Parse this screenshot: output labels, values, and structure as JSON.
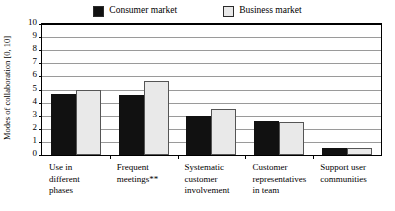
{
  "legend": {
    "position": "top-center",
    "entries": [
      {
        "label": "Consumer market",
        "color": "#111111",
        "swatch_name": "legend-swatch-consumer"
      },
      {
        "label": "Business market",
        "color": "#e9e9e9",
        "swatch_name": "legend-swatch-business"
      }
    ]
  },
  "axis": {
    "y_title": "Modes of collaboration [0, 10]",
    "y_ticks": [
      "10",
      "9",
      "8",
      "7",
      "6",
      "5",
      "4",
      "3",
      "2",
      "1",
      "0"
    ]
  },
  "chart_data": {
    "type": "bar",
    "title": "",
    "subtitle": "",
    "xlabel": "",
    "ylabel": "Modes of collaboration [0, 10]",
    "ylim": [
      0,
      10
    ],
    "yticks": [
      0,
      1,
      2,
      3,
      4,
      5,
      6,
      7,
      8,
      9,
      10
    ],
    "grid": true,
    "legend_position": "top-center",
    "categories": [
      "Use in different phases",
      "Frequent meetings**",
      "Systematic customer involvement",
      "Customer representatives in team",
      "Support user communities"
    ],
    "category_lines": [
      [
        "Use in",
        "different",
        "phases"
      ],
      [
        "Frequent",
        "meetings**"
      ],
      [
        "Systematic",
        "customer",
        "involvement"
      ],
      [
        "Customer",
        "representatives",
        "in team"
      ],
      [
        "Support user",
        "communities"
      ]
    ],
    "series": [
      {
        "name": "Consumer market",
        "color": "#111111",
        "values": [
          4.65,
          4.6,
          3.0,
          2.6,
          0.55
        ]
      },
      {
        "name": "Business market",
        "color": "#e9e9e9",
        "values": [
          5.0,
          5.65,
          3.55,
          2.5,
          0.55
        ]
      }
    ],
    "annotations": [
      "** in category 'Frequent meetings'"
    ]
  }
}
